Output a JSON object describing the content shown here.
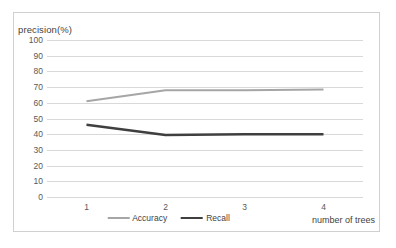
{
  "chart_data": {
    "type": "line",
    "title": "",
    "xlabel": "number of trees",
    "ylabel": "precision(%)",
    "x": [
      1,
      2,
      3,
      4
    ],
    "categories": [
      "1",
      "2",
      "3",
      "4"
    ],
    "xtick_labels": [
      "1",
      "2",
      "3",
      "4"
    ],
    "ytick_labels": [
      "100",
      "90",
      "80",
      "70",
      "60",
      "50",
      "40",
      "30",
      "20",
      "10",
      "0"
    ],
    "ylim": [
      0,
      100
    ],
    "ytick_step": 10,
    "grid": "horizontal",
    "legend_position": "bottom-center",
    "series": [
      {
        "name": "Accuracy",
        "color": "#a6a6a6",
        "line_width": 2,
        "values": [
          61,
          68,
          68,
          68.5
        ]
      },
      {
        "name": "Recall",
        "color": "#3f3f3f",
        "line_width": 2.4,
        "values": [
          46,
          39.5,
          40,
          40
        ]
      }
    ]
  },
  "legend": {
    "items": [
      {
        "label": "Accuracy",
        "color": "#a6a6a6",
        "line_width": 2
      },
      {
        "label": "Recall",
        "color": "#3f3f3f",
        "line_width": 2.4
      }
    ]
  },
  "colors": {
    "accuracy": "#a6a6a6",
    "recall": "#3f3f3f",
    "gridline": "#d9d9d9",
    "border": "#d0d0d0",
    "tick_text": "#595959",
    "axis_title_text": "#3f3f3f",
    "background": "#ffffff"
  }
}
